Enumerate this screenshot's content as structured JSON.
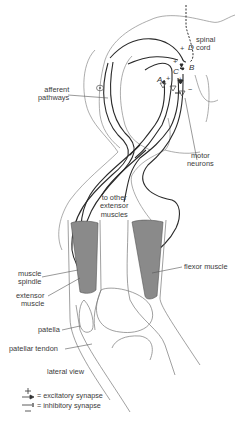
{
  "figure": {
    "colors": {
      "ink": "#2a2a2a",
      "thin": "#777777",
      "muscle": "#8a8a8a",
      "label": "#3a3a3a"
    },
    "labels": {
      "spinal_cord": [
        "spinal",
        "cord"
      ],
      "afferent_pathways": [
        "afferent",
        "pathways"
      ],
      "motor_neurons": [
        "motor",
        "neurons"
      ],
      "to_other_extensor_muscles": [
        "to other",
        "extensor",
        "muscles"
      ],
      "muscle_spindle": [
        "muscle",
        "spindle"
      ],
      "extensor_muscle": [
        "extensor",
        "muscle"
      ],
      "flexor_muscle": "flexor muscle",
      "patella": "patella",
      "patellar_tendon": "patellar tendon",
      "lateral_view": "lateral view"
    },
    "synapse_letters": {
      "A": "A",
      "B": "B",
      "C": "C",
      "D": "D"
    },
    "signs": {
      "plus": "+",
      "minus": "−"
    },
    "legend": {
      "excitatory": {
        "symbol": "excitatory-synapse-arrow",
        "equals": "=",
        "label": "excitatory synapse"
      },
      "inhibitory": {
        "symbol": "inhibitory-synapse-bar",
        "equals": "=",
        "label": "inhibitory synapse"
      }
    }
  }
}
